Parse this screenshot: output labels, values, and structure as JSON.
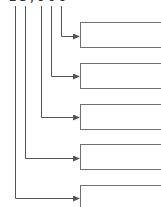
{
  "diagram": {
    "root": {
      "label": "13,000",
      "clipped": true
    },
    "colors": {
      "line": "#555555",
      "box_border": "#707070",
      "background": "#ffffff"
    },
    "branches": [
      {
        "id": "b1",
        "line_x": 61,
        "arrow_y": 36,
        "box_top": 22,
        "label": ""
      },
      {
        "id": "b2",
        "line_x": 51,
        "arrow_y": 76,
        "box_top": 63,
        "label": ""
      },
      {
        "id": "b3",
        "line_x": 41,
        "arrow_y": 117,
        "box_top": 104,
        "label": ""
      },
      {
        "id": "b4",
        "line_x": 25,
        "arrow_y": 158,
        "box_top": 144,
        "label": ""
      },
      {
        "id": "b5",
        "line_x": 15,
        "arrow_y": 198,
        "box_top": 185,
        "label": ""
      }
    ]
  }
}
